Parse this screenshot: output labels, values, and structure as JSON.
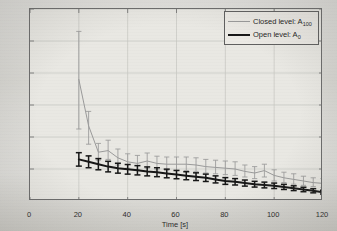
{
  "chart_data": {
    "type": "line",
    "title": "",
    "xlabel": "Time [s]",
    "ylabel": "Relative error in estimation [%]",
    "xlim": [
      0,
      120
    ],
    "ylim": [
      0,
      12
    ],
    "xticks": [
      0,
      20,
      40,
      60,
      80,
      100,
      120
    ],
    "yticks": [
      0,
      2,
      4,
      6,
      8,
      10,
      12
    ],
    "grid": true,
    "legend_position": "top-right",
    "error_bars": true,
    "x": [
      20,
      24,
      28,
      32,
      36,
      40,
      44,
      48,
      52,
      56,
      60,
      64,
      68,
      72,
      76,
      80,
      84,
      88,
      92,
      96,
      100,
      104,
      108,
      112,
      116,
      120
    ],
    "series": [
      {
        "name": "Closed level: A_100",
        "label_main": "Closed level: A",
        "label_sub": "100",
        "color": "#9a9a9a",
        "linewidth": 1,
        "values": [
          7.6,
          4.7,
          3.05,
          3.15,
          2.7,
          2.45,
          2.35,
          2.5,
          2.35,
          2.3,
          2.3,
          2.3,
          2.25,
          2.15,
          2.1,
          2.05,
          2.0,
          1.85,
          1.75,
          1.9,
          1.6,
          1.45,
          1.35,
          1.25,
          1.15,
          1.1
        ],
        "err_low": [
          4.5,
          3.55,
          2.55,
          2.6,
          2.25,
          2.05,
          1.95,
          2.05,
          1.95,
          1.9,
          1.9,
          1.9,
          1.85,
          1.75,
          1.7,
          1.65,
          1.6,
          1.5,
          1.4,
          1.5,
          1.25,
          1.15,
          1.05,
          0.98,
          0.9,
          0.85
        ],
        "err_high": [
          10.6,
          5.6,
          3.6,
          3.8,
          3.25,
          2.95,
          2.85,
          3.0,
          2.8,
          2.75,
          2.75,
          2.75,
          2.7,
          2.6,
          2.55,
          2.5,
          2.45,
          2.25,
          2.15,
          2.3,
          1.95,
          1.8,
          1.7,
          1.55,
          1.45,
          1.4
        ]
      },
      {
        "name": "Open level: A_0",
        "label_main": "Open level: A",
        "label_sub": "0",
        "color": "#161616",
        "linewidth": 2,
        "values": [
          2.6,
          2.45,
          2.3,
          2.15,
          2.05,
          1.98,
          1.92,
          1.85,
          1.8,
          1.72,
          1.65,
          1.58,
          1.52,
          1.45,
          1.35,
          1.25,
          1.2,
          1.12,
          1.05,
          1.0,
          0.95,
          0.88,
          0.8,
          0.72,
          0.64,
          0.55
        ],
        "err_low": [
          2.18,
          2.08,
          1.95,
          1.82,
          1.74,
          1.68,
          1.63,
          1.57,
          1.52,
          1.45,
          1.39,
          1.33,
          1.28,
          1.22,
          1.13,
          1.04,
          1.0,
          0.93,
          0.87,
          0.82,
          0.78,
          0.72,
          0.65,
          0.58,
          0.51,
          0.43
        ],
        "err_high": [
          3.02,
          2.82,
          2.65,
          2.48,
          2.36,
          2.28,
          2.21,
          2.13,
          2.08,
          1.99,
          1.91,
          1.83,
          1.76,
          1.68,
          1.57,
          1.46,
          1.4,
          1.31,
          1.23,
          1.18,
          1.12,
          1.04,
          0.95,
          0.86,
          0.77,
          0.67
        ]
      }
    ]
  },
  "axes": {
    "xlabel": "Time [s]",
    "ylabel": "Relative error in estimation [%]",
    "xtick_labels": [
      "0",
      "20",
      "40",
      "60",
      "80",
      "100",
      "120"
    ],
    "ytick_labels": [
      "0",
      "2",
      "4",
      "6",
      "8",
      "10",
      "12"
    ]
  },
  "legend": {
    "items": [
      {
        "main": "Closed level: A",
        "sub": "100"
      },
      {
        "main": "Open level: A",
        "sub": "0"
      }
    ]
  },
  "colors": {
    "closed_level": "#9a9a9a",
    "open_level": "#161616",
    "grid": "#c6c5c0",
    "axis": "#6c6c6c",
    "plot_background": "#e9e8e3",
    "figure_background": "#d3d2cd"
  }
}
